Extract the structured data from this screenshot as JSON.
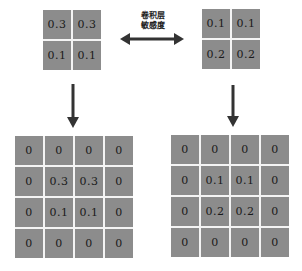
{
  "relation_label": {
    "line1": "卷积层",
    "line2": "敏感度"
  },
  "colors": {
    "cell_fill": "#8c8c8c",
    "cell_border": "#f4f4f4",
    "arrow": "#333333",
    "text": "#1a1a1a"
  },
  "matrices": {
    "top_left": {
      "rows": [
        [
          "0.3",
          "0.3"
        ],
        [
          "0.1",
          "0.1"
        ]
      ]
    },
    "top_right": {
      "rows": [
        [
          "0.1",
          "0.1"
        ],
        [
          "0.2",
          "0.2"
        ]
      ]
    },
    "bottom_left": {
      "rows": [
        [
          "0",
          "0",
          "0",
          "0"
        ],
        [
          "0",
          "0.3",
          "0.3",
          "0"
        ],
        [
          "0",
          "0.1",
          "0.1",
          "0"
        ],
        [
          "0",
          "0",
          "0",
          "0"
        ]
      ]
    },
    "bottom_right": {
      "rows": [
        [
          "0",
          "0",
          "0",
          "0"
        ],
        [
          "0",
          "0.1",
          "0.1",
          "0"
        ],
        [
          "0",
          "0.2",
          "0.2",
          "0"
        ],
        [
          "0",
          "0",
          "0",
          "0"
        ]
      ]
    }
  },
  "arrows": [
    {
      "name": "double-arrow",
      "from": "top_left",
      "to": "top_right",
      "direction": "bidirectional"
    },
    {
      "name": "left-down-arrow",
      "from": "top_left",
      "to": "bottom_left",
      "direction": "down"
    },
    {
      "name": "right-down-arrow",
      "from": "top_right",
      "to": "bottom_right",
      "direction": "down"
    }
  ]
}
